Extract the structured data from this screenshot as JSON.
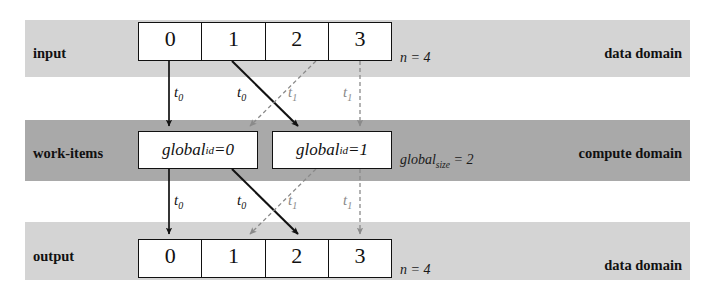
{
  "colors": {
    "band_light": "#d4d4d4",
    "band_dark": "#a9a9a9",
    "box_fill": "#ffffff",
    "stroke_solid": "#121212",
    "stroke_dashed": "#8a8a8a"
  },
  "rows": {
    "input": {
      "row_label": "input",
      "domain_label": "data domain",
      "size_label_prefix": "n",
      "size_label_eq": " = ",
      "size_label_value": "4",
      "cells": [
        "0",
        "1",
        "2",
        "3"
      ]
    },
    "compute": {
      "row_label": "work-items",
      "domain_label": "compute domain",
      "size_label_prefix": "global",
      "size_label_sub": "size",
      "size_label_eq": " = ",
      "size_label_value": "2",
      "items": [
        {
          "name": "global",
          "sub": "id",
          "eq": " = ",
          "value": "0"
        },
        {
          "name": "global",
          "sub": "id",
          "eq": " = ",
          "value": "1"
        }
      ]
    },
    "output": {
      "row_label": "output",
      "domain_label": "data domain",
      "size_label_prefix": "n",
      "size_label_eq": " = ",
      "size_label_value": "4",
      "cells": [
        "0",
        "1",
        "2",
        "3"
      ]
    }
  },
  "thread_labels": {
    "upper": [
      {
        "name": "t",
        "sub": "0",
        "style": "solid"
      },
      {
        "name": "t",
        "sub": "0",
        "style": "solid"
      },
      {
        "name": "t",
        "sub": "1",
        "style": "dashed"
      },
      {
        "name": "t",
        "sub": "1",
        "style": "dashed"
      }
    ],
    "lower": [
      {
        "name": "t",
        "sub": "0",
        "style": "solid"
      },
      {
        "name": "t",
        "sub": "0",
        "style": "solid"
      },
      {
        "name": "t",
        "sub": "1",
        "style": "dashed"
      },
      {
        "name": "t",
        "sub": "1",
        "style": "dashed"
      }
    ]
  },
  "edges": {
    "upper": [
      {
        "from_cell": "0",
        "to_item": "0",
        "style": "solid",
        "kind": "vertical"
      },
      {
        "from_cell": "1",
        "to_item": "1",
        "style": "solid",
        "kind": "diagonal-right"
      },
      {
        "from_cell": "2",
        "to_item": "0",
        "style": "dashed",
        "kind": "diagonal-left"
      },
      {
        "from_cell": "3",
        "to_item": "1",
        "style": "dashed",
        "kind": "vertical"
      }
    ],
    "lower": [
      {
        "from_item": "0",
        "to_cell": "0",
        "style": "solid",
        "kind": "vertical"
      },
      {
        "from_item": "0",
        "to_cell": "2",
        "style": "solid",
        "kind": "diagonal-right"
      },
      {
        "from_item": "1",
        "to_cell": "1",
        "style": "dashed",
        "kind": "diagonal-left"
      },
      {
        "from_item": "1",
        "to_cell": "3",
        "style": "dashed",
        "kind": "vertical"
      }
    ]
  }
}
